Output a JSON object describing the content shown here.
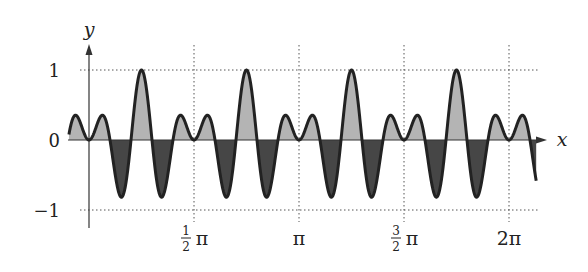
{
  "chart_data": {
    "type": "area",
    "function": "sin(2x)*sin(10x)",
    "x_range": [
      -0.3,
      6.69
    ],
    "title": "",
    "xlabel": "x",
    "ylabel": "y",
    "ylim": [
      -1,
      1
    ],
    "grid": "dotted at x = π/2, π, 3π/2, 2π and y = 1, -1",
    "fills": {
      "positive": "#b4b4b4",
      "negative": "#464646"
    },
    "stroke": "#222222"
  },
  "axes": {
    "x_label": "x",
    "y_label": "y",
    "y_ticks": [
      {
        "value": 1,
        "label": "1"
      },
      {
        "value": 0,
        "label": "0"
      },
      {
        "value": -1,
        "label": "−1"
      }
    ],
    "x_ticks": [
      {
        "value": 1.5708,
        "num": "1",
        "den": "2",
        "suffix": "π"
      },
      {
        "value": 3.14159,
        "label": "π"
      },
      {
        "value": 4.7124,
        "num": "3",
        "den": "2",
        "suffix": "π"
      },
      {
        "value": 6.28318,
        "label": "2π"
      }
    ]
  }
}
